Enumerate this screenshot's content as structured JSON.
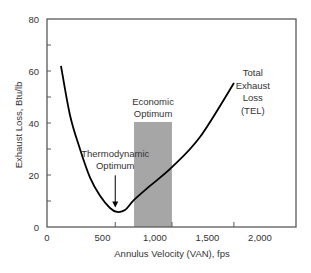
{
  "chart_data": {
    "type": "line",
    "title": "",
    "xlabel": "Annulus Velocity (VAN), fps",
    "ylabel": "Exhaust Loss, Btu/lb",
    "xlim": [
      0,
      2370
    ],
    "ylim": [
      0,
      80
    ],
    "grid": false,
    "legend": null,
    "x_tick_labels": [
      "0",
      "500",
      "1,000",
      "1,500",
      "2,000"
    ],
    "x_tick_label_values": [
      0,
      500,
      1000,
      1500,
      2000
    ],
    "x_tick_mark_values": [
      650,
      1190,
      1780
    ],
    "y_tick_labels": [
      "0",
      "20",
      "40",
      "60",
      "80"
    ],
    "y_tick_values": [
      0,
      20,
      40,
      60,
      80
    ],
    "y_minor_tick_values": [
      10,
      30,
      50,
      70
    ],
    "series": [
      {
        "name": "Total Exhaust Loss (TEL)",
        "color": "#000000",
        "x": [
          133,
          219,
          314,
          410,
          505,
          600,
          667,
          743,
          829,
          981,
          1190,
          1457,
          1781
        ],
        "y": [
          62,
          43,
          30,
          19,
          12,
          7.3,
          5.8,
          6.5,
          10.4,
          15.8,
          23,
          34.6,
          55.4
        ]
      }
    ],
    "shaded_regions": [
      {
        "name": "Economic Optimum",
        "x0": 829,
        "x1": 1190,
        "y0": 0,
        "y1": 40.4,
        "color": "#a6a6a6"
      }
    ],
    "annotations": [
      {
        "name": "tel-label",
        "lines": [
          "Total",
          "Exhaust",
          "Loss",
          "(TEL)"
        ],
        "x": 1960,
        "y": 58
      },
      {
        "name": "economic-optimum-label",
        "lines": [
          "Economic",
          "Optimum"
        ],
        "x": 1010,
        "y": 47
      },
      {
        "name": "thermodynamic-optimum-label",
        "lines": [
          "Thermodynamic",
          "Optimum"
        ],
        "x": 650,
        "y": 27,
        "arrow_to": [
          650,
          7.5
        ]
      }
    ]
  },
  "colors": {
    "axis": "#595959",
    "curve": "#000000",
    "shade": "#a6a6a6",
    "text": "#333333"
  }
}
